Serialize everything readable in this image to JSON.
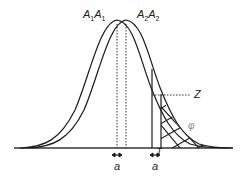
{
  "figure": {
    "labels": {
      "peak_left_main": "A",
      "peak_left_sub": "1",
      "peak_left_main2": "A",
      "peak_left_sub2": "1",
      "peak_right_main": "A",
      "peak_right_sub": "2",
      "peak_right_main2": "A",
      "peak_right_sub2": "2",
      "z": "Z",
      "phi": "φ",
      "t": "T",
      "a_left": "a",
      "a_right": "a"
    },
    "colors": {
      "line": "#1a1a1a",
      "baseline": "#333333",
      "phi": "#888888"
    }
  }
}
